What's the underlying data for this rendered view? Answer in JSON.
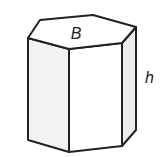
{
  "figure": {
    "type": "hexagonal-prism",
    "labels": {
      "base": "B",
      "height": "h"
    },
    "colors": {
      "stroke": "#222222",
      "left_face": "#f2f2f2",
      "front_face": "#ffffff",
      "right_face": "#ececec",
      "top_face": "#ffffff"
    }
  }
}
